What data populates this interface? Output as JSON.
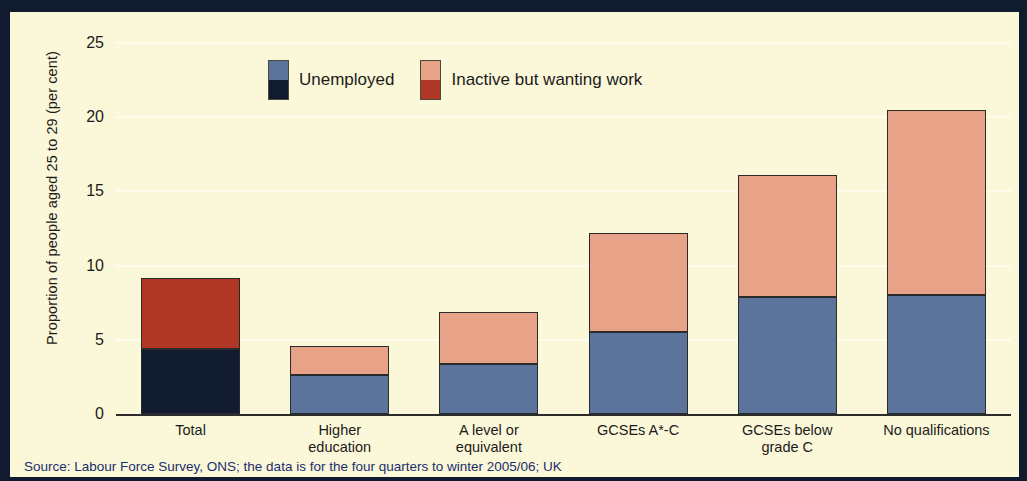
{
  "figure": {
    "background_color": "#fbf8d9",
    "frame_color": "#101b30",
    "source_note": "Source: Labour Force Survey, ONS; the data is for the four quarters to winter 2005/06; UK"
  },
  "legend": {
    "items": [
      {
        "label": "Unemployed",
        "color_light": "#5c749b",
        "color_dark": "#101b30"
      },
      {
        "label": "Inactive but wanting work",
        "color_light": "#e8a288",
        "color_dark": "#b03626"
      }
    ]
  },
  "chart_data": {
    "type": "bar",
    "title": "",
    "subtitle": "",
    "xlabel": "",
    "ylabel": "Proportion of people aged 25 to 29 (per cent)",
    "ylim": [
      0,
      25
    ],
    "yticks": [
      0,
      5,
      10,
      15,
      20,
      25
    ],
    "ytick_labels": [
      "0",
      "5",
      "10",
      "15",
      "20",
      "25"
    ],
    "grid": "horizontal",
    "stacked": true,
    "legend_position": "top-center",
    "categories": [
      "Total",
      "Higher education",
      "A level or equivalent",
      "GCSEs A*-C",
      "GCSEs below grade C",
      "No qualifications"
    ],
    "category_lines": [
      [
        "Total"
      ],
      [
        "Higher",
        "education"
      ],
      [
        "A level or",
        "equivalent"
      ],
      [
        "GCSEs A*-C"
      ],
      [
        "GCSEs below",
        "grade C"
      ],
      [
        "No qualifications"
      ]
    ],
    "series": [
      {
        "name": "Unemployed",
        "values": [
          4.4,
          2.6,
          3.4,
          5.5,
          7.9,
          8.0
        ]
      },
      {
        "name": "Inactive but wanting work",
        "values": [
          4.8,
          2.0,
          3.5,
          6.7,
          8.2,
          12.5
        ]
      }
    ],
    "totals": [
      9.2,
      4.6,
      6.9,
      12.2,
      16.1,
      20.5
    ],
    "highlight_category_index": 0,
    "highlight_colors": {
      "unemployed": "#101b30",
      "inactive": "#b03626"
    },
    "standard_colors": {
      "unemployed": "#5c749b",
      "inactive": "#e8a288"
    }
  }
}
